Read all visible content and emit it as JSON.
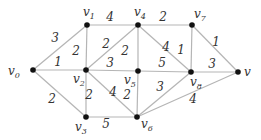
{
  "diagram": {
    "type": "weighted-undirected-graph",
    "colors": {
      "edge": "#b5b5b5",
      "node": "#111111",
      "text": "#333333"
    },
    "nodes": [
      {
        "id": "v0",
        "base": "v",
        "sub": "0",
        "x": 33,
        "y": 70,
        "lx": 8,
        "ly": 75
      },
      {
        "id": "v1",
        "base": "v",
        "sub": "1",
        "x": 87,
        "y": 25,
        "lx": 83,
        "ly": 16
      },
      {
        "id": "v2",
        "base": "v",
        "sub": "2",
        "x": 86,
        "y": 70,
        "lx": 73,
        "ly": 83
      },
      {
        "id": "v3",
        "base": "v",
        "sub": "3",
        "x": 86,
        "y": 117,
        "lx": 75,
        "ly": 131
      },
      {
        "id": "v4",
        "base": "v",
        "sub": "4",
        "x": 138,
        "y": 25,
        "lx": 134,
        "ly": 16
      },
      {
        "id": "v5",
        "base": "v",
        "sub": "5",
        "x": 138,
        "y": 71,
        "lx": 124,
        "ly": 84
      },
      {
        "id": "v6",
        "base": "v",
        "sub": "6",
        "x": 137,
        "y": 117,
        "lx": 141,
        "ly": 128
      },
      {
        "id": "v7",
        "base": "v",
        "sub": "7",
        "x": 192,
        "y": 25,
        "lx": 194,
        "ly": 18
      },
      {
        "id": "v8",
        "base": "v",
        "sub": "8",
        "x": 191,
        "y": 72,
        "lx": 190,
        "ly": 86
      },
      {
        "id": "v",
        "base": "v",
        "sub": "",
        "x": 238,
        "y": 72,
        "lx": 244,
        "ly": 76
      }
    ],
    "edges": [
      {
        "from": "v0",
        "to": "v1",
        "weight": "3",
        "lx": 55,
        "ly": 42
      },
      {
        "from": "v0",
        "to": "v2",
        "weight": "1",
        "lx": 58,
        "ly": 66
      },
      {
        "from": "v0",
        "to": "v3",
        "weight": "2",
        "lx": 52,
        "ly": 103
      },
      {
        "from": "v1",
        "to": "v4",
        "weight": "4",
        "lx": 110,
        "ly": 21
      },
      {
        "from": "v1",
        "to": "v2",
        "weight": "2",
        "lx": 76,
        "ly": 55
      },
      {
        "from": "v2",
        "to": "v4",
        "weight": "2",
        "lx": 106,
        "ly": 48
      },
      {
        "from": "v2",
        "to": "v5",
        "weight": "3",
        "lx": 110,
        "ly": 67
      },
      {
        "from": "v2",
        "to": "v6",
        "weight": "4",
        "lx": 113,
        "ly": 96
      },
      {
        "from": "v2",
        "to": "v3",
        "weight": "2",
        "lx": 89,
        "ly": 99
      },
      {
        "from": "v3",
        "to": "v6",
        "weight": "5",
        "lx": 106,
        "ly": 128
      },
      {
        "from": "v4",
        "to": "v7",
        "weight": "2",
        "lx": 163,
        "ly": 21
      },
      {
        "from": "v4",
        "to": "v5",
        "weight": "2",
        "lx": 125,
        "ly": 55
      },
      {
        "from": "v4",
        "to": "v8",
        "weight": "4",
        "lx": 166,
        "ly": 51
      },
      {
        "from": "v5",
        "to": "v8",
        "weight": "5",
        "lx": 162,
        "ly": 67
      },
      {
        "from": "v5",
        "to": "v6",
        "weight": "2",
        "lx": 127,
        "ly": 99
      },
      {
        "from": "v7",
        "to": "v8",
        "weight": "1",
        "lx": 181,
        "ly": 54
      },
      {
        "from": "v7",
        "to": "v",
        "weight": "1",
        "lx": 216,
        "ly": 46
      },
      {
        "from": "v8",
        "to": "v",
        "weight": "3",
        "lx": 212,
        "ly": 68
      },
      {
        "from": "v6",
        "to": "v8",
        "weight": "3",
        "lx": 160,
        "ly": 91
      },
      {
        "from": "v6",
        "to": "v",
        "weight": "4",
        "lx": 193,
        "ly": 103
      }
    ]
  }
}
